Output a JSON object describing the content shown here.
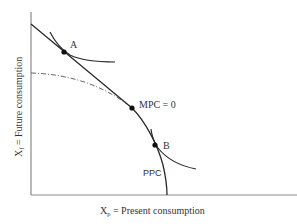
{
  "diagram": {
    "type": "economics-intertemporal-choice",
    "colors": {
      "axis": "#888888",
      "curve": "#2a2a2a",
      "text": "#333333",
      "dash_dot": "#555555"
    },
    "axes": {
      "y_label_main": "X",
      "y_label_sub": "f",
      "y_label_rest": " = Future consumption",
      "x_label_main": "X",
      "x_label_sub": "p",
      "x_label_rest": " = Present consumption"
    },
    "points": [
      {
        "id": "A",
        "label": "A"
      },
      {
        "id": "mpc0",
        "label": "MPC = 0"
      },
      {
        "id": "B",
        "label": "B"
      }
    ],
    "curves": {
      "ppc_label": "PPC"
    }
  }
}
